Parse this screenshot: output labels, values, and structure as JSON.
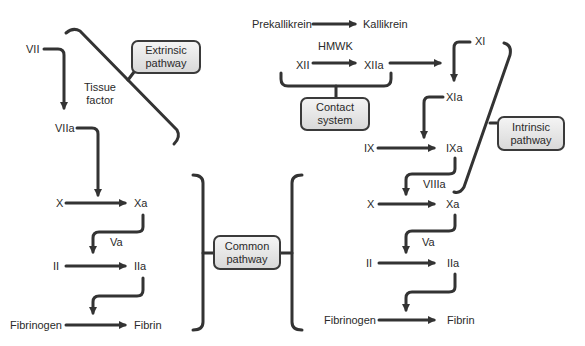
{
  "boxes": {
    "extrinsic": [
      "Extrinsic",
      "pathway"
    ],
    "contact": [
      "Contact",
      "system"
    ],
    "intrinsic": [
      "Intrinsic",
      "pathway"
    ],
    "common": [
      "Common",
      "pathway"
    ]
  },
  "extrinsic": {
    "vii": "VII",
    "viia": "VIIa",
    "tissue_factor": [
      "Tissue",
      "factor"
    ]
  },
  "left_common": {
    "x": "X",
    "xa": "Xa",
    "va": "Va",
    "ii": "II",
    "iia": "IIa",
    "fibrinogen": "Fibrinogen",
    "fibrin": "Fibrin"
  },
  "contact": {
    "prekallikrein": "Prekallikrein",
    "kallikrein": "Kallikrein",
    "hmwk": "HMWK",
    "xii": "XII",
    "xiia": "XIIa"
  },
  "intrinsic": {
    "xi": "XI",
    "xia": "XIa",
    "ix": "IX",
    "ixa": "IXa",
    "viiia": "VIIIa"
  },
  "right_common": {
    "x": "X",
    "xa": "Xa",
    "va": "Va",
    "ii": "II",
    "iia": "IIa",
    "fibrinogen": "Fibrinogen",
    "fibrin": "Fibrin"
  },
  "colors": {
    "stroke": "#333333",
    "box_top": "#f4f4f4",
    "box_bottom": "#d9d9d9",
    "text": "#2a2a2a"
  }
}
